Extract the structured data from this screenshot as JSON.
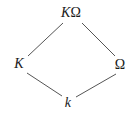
{
  "diagram": {
    "type": "lattice-diamond",
    "title": "",
    "background_color": "#ffffff",
    "edge_color": "#555555",
    "label_color": "#1a1a1a",
    "nodes": [
      {
        "id": "top",
        "name": "composite-field",
        "label_main": "K",
        "label_sub": "Ω",
        "label_full": "KΩ",
        "x": 71,
        "y": 13
      },
      {
        "id": "left",
        "name": "field-K",
        "label_main": "K",
        "label_sub": "",
        "label_full": "K",
        "x": 19,
        "y": 64
      },
      {
        "id": "right",
        "name": "field-omega",
        "label_main": "",
        "label_sub": "Ω",
        "label_full": "Ω",
        "x": 120,
        "y": 65
      },
      {
        "id": "bottom",
        "name": "base-field-k",
        "label_main": "k",
        "label_sub": "",
        "label_full": "k",
        "x": 68,
        "y": 103
      }
    ],
    "edges": [
      {
        "from": "left",
        "to": "top",
        "name": "edge-K-to-KOmega",
        "x1": 28,
        "y1": 56,
        "x2": 63,
        "y2": 23
      },
      {
        "from": "top",
        "to": "right",
        "name": "edge-KOmega-to-Omega",
        "x1": 82,
        "y1": 23,
        "x2": 115,
        "y2": 56
      },
      {
        "from": "bottom",
        "to": "left",
        "name": "edge-k-to-K",
        "x1": 62,
        "y1": 96,
        "x2": 27,
        "y2": 73
      },
      {
        "from": "right",
        "to": "bottom",
        "name": "edge-Omega-to-k",
        "x1": 116,
        "y1": 74,
        "x2": 76,
        "y2": 97
      }
    ]
  }
}
